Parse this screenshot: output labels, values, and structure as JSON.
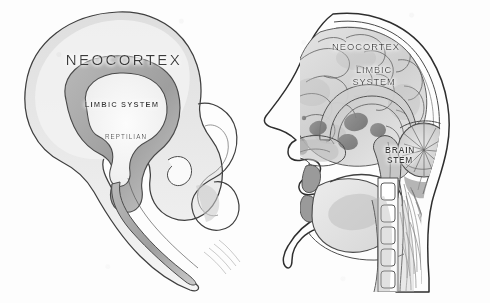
{
  "figure": {
    "background_color": "#fdfdfd",
    "ink_color": "#3b3b3b",
    "medium": "pencil sketch on paper",
    "panels": [
      {
        "id": "schematic",
        "name": "abstract-triune-brain-schematic",
        "description": "Nested outline diagram: large rounded neocortex envelope containing a shaded ring-shaped limbic system which surrounds a pale reptilian core, with a brain stem tapering down to the lower right.",
        "labels": [
          {
            "key": "neocortex",
            "text": "NEOCORTEX"
          },
          {
            "key": "limbic_system",
            "text": "LIMBIC SYSTEM"
          },
          {
            "key": "reptilian",
            "text": "REPTILIAN"
          }
        ]
      },
      {
        "id": "sagittal-head",
        "name": "sagittal-head-cross-section",
        "description": "Mid-sagittal cross-section of a human head in left profile showing skull, gyri of the neocortex, limbic structures, corpus callosum, cerebellum, brain stem, nasal cavity, tongue, jaw, cervical vertebrae and neck musculature.",
        "labels": [
          {
            "key": "neocortex",
            "text": "NEOCORTEX"
          },
          {
            "key": "limbic_line1",
            "text": "LIMBIC"
          },
          {
            "key": "limbic_line2",
            "text": "SYSTEM"
          },
          {
            "key": "brainstem_line1",
            "text": "BRAIN"
          },
          {
            "key": "brainstem_line2",
            "text": "STEM"
          }
        ]
      }
    ]
  }
}
